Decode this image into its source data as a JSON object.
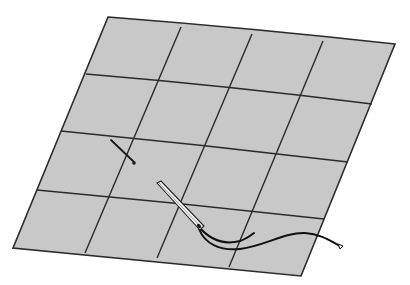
{
  "figure": {
    "colors": {
      "background": "#ffffff",
      "fabric": "#c8c8c8",
      "grid_line": "#2a2a2a",
      "thread": "#111111",
      "needle_fill": "#f2f2f2",
      "needle_outline": "#222222"
    },
    "grid": {
      "rows": 4,
      "cols": 4
    },
    "objects": [
      "fabric-sheet",
      "grid-lines",
      "small-pin",
      "needle",
      "thread"
    ]
  }
}
